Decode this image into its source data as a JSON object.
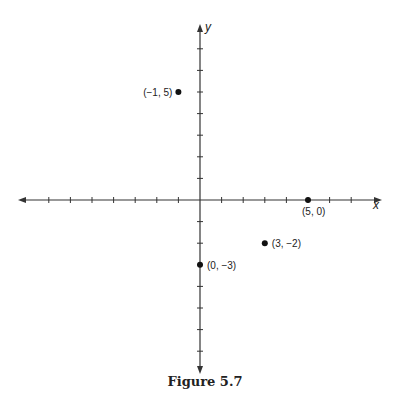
{
  "figure": {
    "caption": "Figure 5.7",
    "axis_labels": {
      "x": "x",
      "y": "y"
    }
  },
  "chart_data": {
    "type": "scatter",
    "title": "Figure 5.7",
    "xlabel": "x",
    "ylabel": "y",
    "xlim": [
      -8,
      8
    ],
    "ylim": [
      -8,
      8
    ],
    "grid": false,
    "ticks_unlabeled": true,
    "points": [
      {
        "x": -1,
        "y": 5,
        "label": "(−1, 5)"
      },
      {
        "x": 5,
        "y": 0,
        "label": "(5, 0)"
      },
      {
        "x": 3,
        "y": -2,
        "label": "(3, −2)"
      },
      {
        "x": 0,
        "y": -3,
        "label": "(0, −3)"
      }
    ]
  },
  "style": {
    "axis_color": "#333333",
    "point_color": "#111111",
    "label_color": "#222222"
  }
}
